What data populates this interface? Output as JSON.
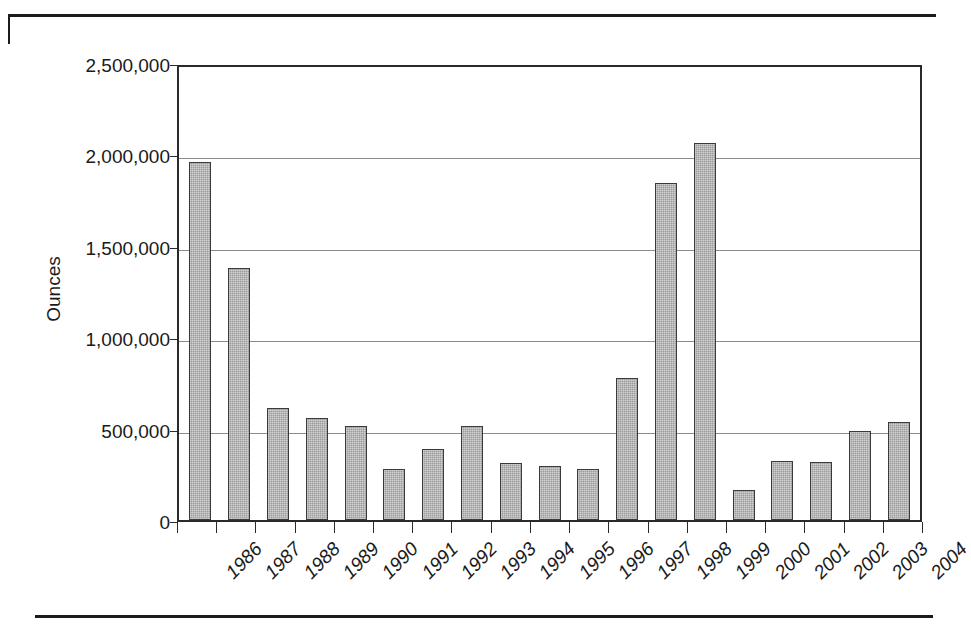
{
  "chart_data": {
    "type": "bar",
    "title": "",
    "xlabel": "",
    "ylabel": "Ounces",
    "ylim": [
      0,
      2500000
    ],
    "grid": true,
    "legend": "none",
    "categories": [
      "1986",
      "1987",
      "1988",
      "1989",
      "1990",
      "1991",
      "1992",
      "1993",
      "1994",
      "1995",
      "1996",
      "1997",
      "1998",
      "1999",
      "2000",
      "2001",
      "2002",
      "2003",
      "2004"
    ],
    "values": [
      1960000,
      1380000,
      615000,
      557000,
      515000,
      280000,
      390000,
      513000,
      310000,
      298000,
      278000,
      775000,
      1845000,
      2060000,
      165000,
      325000,
      318000,
      487000,
      535000
    ],
    "y_tick_labels": [
      "0",
      "500,000",
      "1,000,000",
      "1,500,000",
      "2,000,000",
      "2,500,000"
    ],
    "y_tick_values": [
      0,
      500000,
      1000000,
      1500000,
      2000000,
      2500000
    ],
    "colors": {
      "bar_fill": "#9c9c9c",
      "bar_border": "#3a3a3a",
      "gridline": "#8c8c8c",
      "axis": "#2a2a2a",
      "background": "#ffffff",
      "text": "#1a1a1a"
    }
  }
}
